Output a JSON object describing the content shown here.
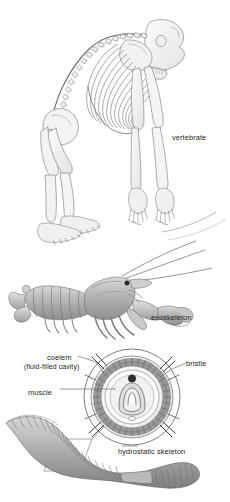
{
  "figure": {
    "background_color": "#ffffff",
    "ink_color": "#4a4a4a",
    "label_color": "#1d1d1d",
    "width": 230,
    "height": 502
  },
  "panels": [
    {
      "id": "vertebrate",
      "subject": "primate skeleton",
      "label": "vertebrate",
      "description": "Side view line drawing of an ape skeleton standing on knuckles"
    },
    {
      "id": "exoskeleton",
      "subject": "lobster",
      "label": "exoskeleton",
      "description": "Side view shaded drawing of a lobster with long antennae and large claw"
    },
    {
      "id": "hydrostatic",
      "subject": "earthworm with cross section",
      "label": "hydrostatic skeleton",
      "description": "Earthworm body with circular cross-section callout showing concentric tissue layers"
    }
  ],
  "labels": {
    "vertebrate": "vertebrate",
    "exoskeleton": "exoskeleton",
    "coelom": "coelem",
    "coelom_sub": "(fluid-filled cavity)",
    "bristle": "bristle",
    "muscle": "muscle",
    "hydrostatic_skeleton": "hydrostatic skeleton"
  },
  "cross_section": {
    "layers": [
      "cuticle",
      "bristle",
      "muscle",
      "coelom",
      "gut",
      "blood vessel"
    ],
    "bristle_count": 8
  }
}
